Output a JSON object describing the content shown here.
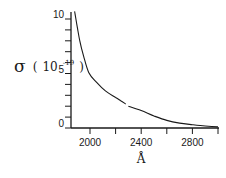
{
  "chart_data": {
    "type": "line",
    "title": "",
    "xlabel": "Å",
    "ylabel": "σ (10⁻¹⁹)",
    "ylabel_parts": {
      "symbol": "σ",
      "open": "(",
      "base": "10",
      "exponent": "-19",
      "close": ")"
    },
    "xlim": [
      1850,
      3000
    ],
    "ylim": [
      0,
      11
    ],
    "x_ticks": [
      2000,
      2200,
      2400,
      2600,
      2800,
      3000
    ],
    "x_tick_labels": [
      "2000",
      "2400",
      "2800"
    ],
    "y_ticks": [
      0,
      1,
      2,
      3,
      4,
      5,
      6,
      7,
      8,
      9,
      10
    ],
    "y_tick_labels": [
      "0",
      "5",
      "10"
    ],
    "grid": false,
    "legend": null,
    "series": [
      {
        "name": "cross section",
        "x": [
          1880,
          1900,
          1920,
          1950,
          1990,
          2050,
          2120,
          2200,
          2240,
          2280
        ],
        "y": [
          10.7,
          9.3,
          8.0,
          6.6,
          5.1,
          4.2,
          3.4,
          2.8,
          2.5,
          2.2
        ]
      },
      {
        "name": "cross section (cont.)",
        "x": [
          2300,
          2400,
          2500,
          2600,
          2700,
          2800,
          2900,
          3000
        ],
        "y": [
          2.0,
          1.6,
          1.1,
          0.7,
          0.45,
          0.3,
          0.18,
          0.1
        ]
      }
    ]
  }
}
